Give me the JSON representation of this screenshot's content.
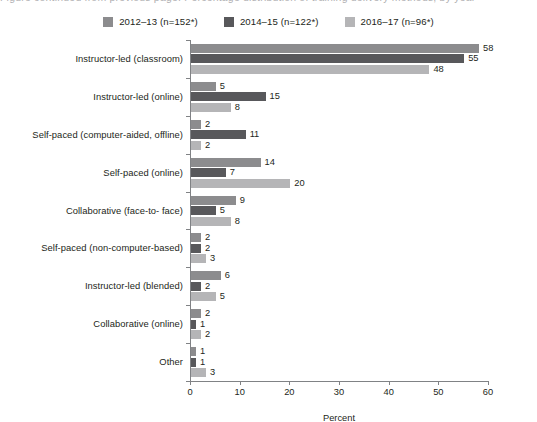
{
  "title_cutoff": "Figure continued from previous page: Percentage distribution of training delivery methods, by year",
  "legend": {
    "items": [
      {
        "label": "2012–13 (n=152*)",
        "color": "#8c8c8e",
        "key": "2012-13"
      },
      {
        "label": "2014–15 (n=122*)",
        "color": "#58585b",
        "key": "2014-15"
      },
      {
        "label": "2016–17 (n=96*)",
        "color": "#b5b5b7",
        "key": "2016-17"
      }
    ]
  },
  "axis": {
    "xlabel": "Percent",
    "xticks": [
      0,
      10,
      20,
      30,
      40,
      50,
      60
    ],
    "xlim": [
      0,
      60
    ],
    "ylabel": ""
  },
  "chart_data": {
    "type": "bar",
    "orientation": "horizontal",
    "title": "",
    "subtitle": "",
    "xlabel": "Percent",
    "ylabel": "",
    "xlim": [
      0,
      60
    ],
    "xticks": [
      0,
      10,
      20,
      30,
      40,
      50,
      60
    ],
    "grid": false,
    "legend_position": "top-center",
    "categories": [
      "Instructor-led (classroom)",
      "Instructor-led (online)",
      "Self-paced (computer-aided, offline)",
      "Self-paced (online)",
      "Collaborative (face-to- face)",
      "Self-paced (non-computer-based)",
      "Instructor-led (blended)",
      "Collaborative (online)",
      "Other"
    ],
    "series": [
      {
        "name": "2012–13 (n=152*)",
        "color": "#8c8c8e",
        "values": [
          58,
          5,
          2,
          14,
          9,
          2,
          6,
          2,
          1
        ]
      },
      {
        "name": "2014–15 (n=122*)",
        "color": "#58585b",
        "values": [
          55,
          15,
          11,
          7,
          5,
          2,
          2,
          1,
          1
        ]
      },
      {
        "name": "2016–17 (n=96*)",
        "color": "#b5b5b7",
        "values": [
          48,
          8,
          2,
          20,
          8,
          3,
          5,
          2,
          3
        ]
      }
    ]
  }
}
